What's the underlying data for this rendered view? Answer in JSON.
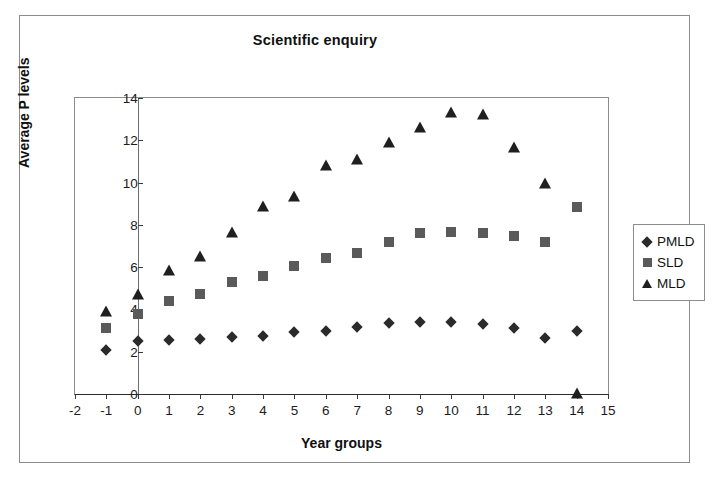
{
  "chart_data": {
    "type": "scatter",
    "title": "Scientific enquiry",
    "xlabel": "Year groups",
    "ylabel": "Average P levels",
    "xlim": [
      -2,
      15
    ],
    "ylim": [
      0,
      14
    ],
    "xticks": [
      "-2",
      "-1",
      "0",
      "1",
      "2",
      "3",
      "4",
      "5",
      "6",
      "7",
      "8",
      "9",
      "10",
      "11",
      "12",
      "13",
      "14",
      "15"
    ],
    "yticks": [
      "0",
      "2",
      "4",
      "6",
      "8",
      "10",
      "12",
      "14"
    ],
    "grid": false,
    "legend_position": "right",
    "x": [
      -1,
      0,
      1,
      2,
      3,
      4,
      5,
      6,
      7,
      8,
      9,
      10,
      11,
      12,
      13,
      14
    ],
    "series": [
      {
        "name": "PMLD",
        "marker": "diamond",
        "color": "#2a2a2a",
        "values": [
          2.1,
          2.5,
          2.55,
          2.6,
          2.7,
          2.75,
          2.95,
          3.0,
          3.15,
          3.35,
          3.4,
          3.4,
          3.3,
          3.1,
          2.65,
          3.0
        ]
      },
      {
        "name": "SLD",
        "marker": "square",
        "color": "#5a5a5a",
        "values": [
          3.1,
          3.8,
          4.4,
          4.75,
          5.3,
          5.6,
          6.05,
          6.45,
          6.65,
          7.2,
          7.6,
          7.65,
          7.6,
          7.45,
          7.2,
          8.85
        ]
      },
      {
        "name": "MLD",
        "marker": "triangle",
        "color": "#1f1f1f",
        "values": [
          3.9,
          4.7,
          5.8,
          6.5,
          7.6,
          8.85,
          9.3,
          10.8,
          11.05,
          11.85,
          12.6,
          13.3,
          13.2,
          11.65,
          9.95,
          0.0
        ]
      }
    ]
  },
  "legend": {
    "entries": [
      {
        "label": "PMLD",
        "key": "diamond-marker-icon"
      },
      {
        "label": "SLD",
        "key": "square-marker-icon"
      },
      {
        "label": "MLD",
        "key": "triangle-marker-icon"
      }
    ]
  }
}
